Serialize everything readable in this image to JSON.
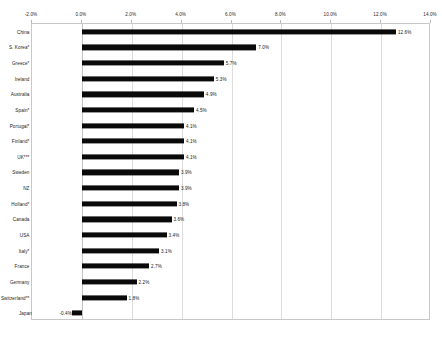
{
  "chart_data": {
    "type": "bar",
    "orientation": "horizontal",
    "title": "",
    "subtitle": "",
    "xlabel": "",
    "ylabel": "",
    "xlim": [
      -2.0,
      14.0
    ],
    "xtick_step": 2.0,
    "xtick_labels": [
      "-2.0%",
      "0.0%",
      "2.0%",
      "4.0%",
      "6.0%",
      "8.0%",
      "10.0%",
      "12.0%",
      "14.0%"
    ],
    "xtick_values": [
      -2.0,
      0.0,
      2.0,
      4.0,
      6.0,
      8.0,
      10.0,
      12.0,
      14.0
    ],
    "axis_position": "top",
    "grid": true,
    "grid_axis": "x",
    "legend": false,
    "bar_color": "#0a0a0a",
    "grid_color": "#dcdcdc",
    "frame_color": "#c8c8c8",
    "background": "#ffffff",
    "value_label_format": "0.0%",
    "categories": [
      "China",
      "S. Korea*",
      "Greece*",
      "Ireland",
      "Australia",
      "Spain*",
      "Portugal*",
      "Finland*",
      "UK***",
      "Sweden",
      "NZ",
      "Holland*",
      "Canada",
      "USA",
      "Italy*",
      "France",
      "Germany",
      "Switzerland**",
      "Japan"
    ],
    "values": [
      12.6,
      7.0,
      5.7,
      5.3,
      4.9,
      4.5,
      4.1,
      4.1,
      4.1,
      3.9,
      3.9,
      3.8,
      3.6,
      3.4,
      3.1,
      2.7,
      2.2,
      1.8,
      -0.4
    ],
    "value_labels": [
      "12.6%",
      "7.0%",
      "5.7%",
      "5.3%",
      "4.9%",
      "4.5%",
      "4.1%",
      "4.1%",
      "4.1%",
      "3.9%",
      "3.9%",
      "3.8%",
      "3.6%",
      "3.4%",
      "3.1%",
      "2.7%",
      "2.2%",
      "1.8%",
      "-0.4%"
    ]
  }
}
